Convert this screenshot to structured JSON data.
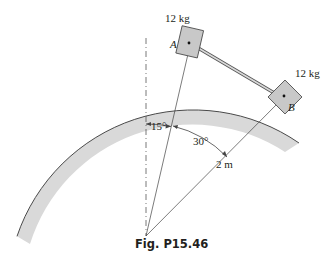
{
  "figure": {
    "caption": "Fig. P15.46",
    "block_a": {
      "label": "A",
      "mass": "12 kg"
    },
    "block_b": {
      "label": "B",
      "mass": "12 kg"
    },
    "angle_1": "15°",
    "angle_2": "30°",
    "radius": "2 m",
    "colors": {
      "surface": "#d9d9d9",
      "block": "#c8c8c8",
      "line": "#231f20"
    }
  }
}
